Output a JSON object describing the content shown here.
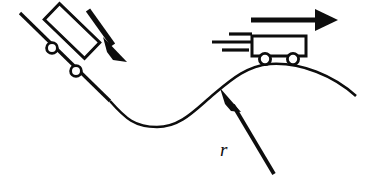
{
  "figure": {
    "background_color": "#ffffff",
    "ink_color": "#0d0d0d",
    "width": 367,
    "height": 183
  },
  "labels": {
    "radius": "r"
  },
  "elements": {
    "incline_name": "inclined-ramp-line",
    "incline_cart_name": "cart-on-incline",
    "incline_arrow_name": "downhill-motion-arrow",
    "track_name": "curved-track-path",
    "crest_cart_name": "cart-on-crest",
    "crest_arrow_name": "horizontal-velocity-arrow",
    "speed_lines_name": "motion-speed-lines",
    "radius_arrow_name": "radius-pointer-arrow",
    "radius_label_name": "radius-label"
  },
  "geometry": {
    "incline": {
      "x1": 20,
      "y1": 13,
      "x2": 110,
      "y2": 101,
      "stroke_width": 3.2
    },
    "incline_cart": {
      "angle_deg": 44,
      "body": {
        "x": 44,
        "y": 22,
        "width": 54,
        "height": 21,
        "stroke_width": 3
      },
      "wheels": [
        {
          "cx": 53,
          "cy": 47,
          "r": 5.2
        },
        {
          "cx": 76,
          "cy": 70,
          "r": 5.2
        }
      ]
    },
    "incline_arrow": {
      "x1": 88,
      "y1": 10,
      "x2": 112,
      "y2": 47,
      "stroke_width": 5,
      "head": "M 104,40 L 126,62 L 110,60 L 106,55 Z"
    },
    "track": {
      "path": "M 110,101 C 126,118 136,127 157,127 C 182,127 196,108 214,93 C 232,78 248,66 270,64 C 300,62 334,76 356,96",
      "stroke_width": 2.6
    },
    "crest_cart": {
      "body": {
        "x": 252,
        "y": 36,
        "width": 54,
        "height": 20,
        "stroke_width": 3
      },
      "wheels": [
        {
          "cx": 265,
          "cy": 59,
          "r": 5.4
        },
        {
          "cx": 293,
          "cy": 59,
          "r": 5.4
        }
      ]
    },
    "crest_arrow": {
      "x1": 251,
      "y1": 20,
      "x2": 320,
      "y2": 20,
      "stroke_width": 5,
      "head": "M 316,10 L 338,20 L 316,31 Z"
    },
    "speed_lines": [
      {
        "x1": 228,
        "y1": 34,
        "x2": 252,
        "y2": 34,
        "stroke_width": 3.2
      },
      {
        "x1": 213,
        "y1": 42,
        "x2": 251,
        "y2": 42,
        "stroke_width": 3.2
      },
      {
        "x1": 222,
        "y1": 50,
        "x2": 248,
        "y2": 50,
        "stroke_width": 3.2
      }
    ],
    "radius_arrow": {
      "x1": 274,
      "y1": 174,
      "x2": 231,
      "y2": 103,
      "stroke_width": 3.6,
      "head": "M 221,88 L 239,109 L 230,109 L 222,105 Z"
    },
    "radius_label": {
      "x": 221,
      "y": 155
    }
  }
}
